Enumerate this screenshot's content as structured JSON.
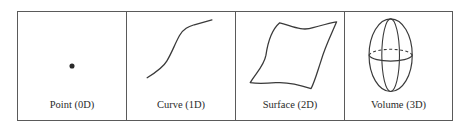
{
  "figure": {
    "stroke_color": "#3a3a3a",
    "border_color": "#5a5a5a",
    "panels": [
      {
        "id": "point",
        "label": "Point (0D)",
        "dimension": 0,
        "shape": "dot"
      },
      {
        "id": "curve",
        "label": "Curve (1D)",
        "dimension": 1,
        "shape": "s-curve"
      },
      {
        "id": "surface",
        "label": "Surface (2D)",
        "dimension": 2,
        "shape": "wavy-quadrilateral"
      },
      {
        "id": "volume",
        "label": "Volume (3D)",
        "dimension": 3,
        "shape": "ellipsoid"
      }
    ]
  }
}
